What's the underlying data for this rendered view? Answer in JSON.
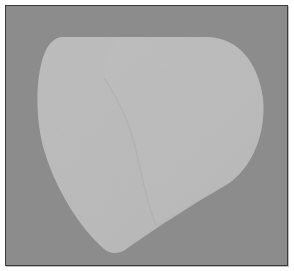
{
  "image": {
    "subject": "rendered truncated cone (frustum)",
    "colors": {
      "background": "#8c8c8c",
      "shape_fill": "#b9b9b9",
      "shape_highlight": "#bdbdbd",
      "shape_shade": "#b0b0b0",
      "rim_line": "#a9a9a9",
      "frame_border": "#3a3a3a"
    }
  }
}
